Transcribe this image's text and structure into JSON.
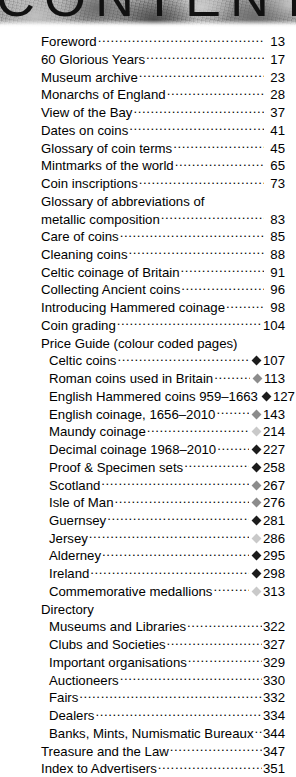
{
  "header": {
    "title": "CONTENTS"
  },
  "colors": {
    "diamond_dark": "#1c1c1c",
    "diamond_mid": "#8c8c8c",
    "diamond_light": "#c9c9c9",
    "text": "#000000"
  },
  "toc": {
    "entries": [
      {
        "label": "Foreword",
        "page": "13",
        "indent": 0,
        "marker": "none"
      },
      {
        "label": "60 Glorious Years",
        "page": "17",
        "indent": 0,
        "marker": "none"
      },
      {
        "label": "Museum archive",
        "page": "23",
        "indent": 0,
        "marker": "none"
      },
      {
        "label": "Monarchs of England",
        "page": "28",
        "indent": 0,
        "marker": "none"
      },
      {
        "label": "View of the Bay",
        "page": "37",
        "indent": 0,
        "marker": "none"
      },
      {
        "label": "Dates on coins",
        "page": "41",
        "indent": 0,
        "marker": "none"
      },
      {
        "label": "Glossary of coin terms",
        "page": "45",
        "indent": 0,
        "marker": "none"
      },
      {
        "label": "Mintmarks of the world",
        "page": "65",
        "indent": 0,
        "marker": "none"
      },
      {
        "label": "Coin inscriptions",
        "page": "73",
        "indent": 0,
        "marker": "none"
      },
      {
        "label": "Glossary of abbreviations of",
        "page": "",
        "indent": 0,
        "marker": "none",
        "continues": true
      },
      {
        "label": "metallic composition",
        "page": "83",
        "indent": 0,
        "marker": "none"
      },
      {
        "label": "Care of coins",
        "page": "85",
        "indent": 0,
        "marker": "none"
      },
      {
        "label": "Cleaning coins",
        "page": "88",
        "indent": 0,
        "marker": "none"
      },
      {
        "label": "Celtic coinage of Britain",
        "page": "91",
        "indent": 0,
        "marker": "none"
      },
      {
        "label": "Collecting Ancient coins",
        "page": "96",
        "indent": 0,
        "marker": "none"
      },
      {
        "label": "Introducing Hammered coinage",
        "page": "98",
        "indent": 0,
        "marker": "none"
      },
      {
        "label": "Coin grading",
        "page": "104",
        "indent": 0,
        "marker": "none"
      },
      {
        "label": "Price Guide (colour coded pages)",
        "page": "",
        "indent": 0,
        "marker": "none",
        "heading": true
      },
      {
        "label": "Celtic coins",
        "page": "107",
        "indent": 1,
        "marker": "dark"
      },
      {
        "label": "Roman coins used in Britain",
        "page": "113",
        "indent": 1,
        "marker": "mid"
      },
      {
        "label": "English Hammered coins 959–1663",
        "page": "127",
        "indent": 1,
        "marker": "dark"
      },
      {
        "label": "English coinage, 1656–2010",
        "page": "143",
        "indent": 1,
        "marker": "mid"
      },
      {
        "label": "Maundy coinage",
        "page": "214",
        "indent": 1,
        "marker": "light"
      },
      {
        "label": "Decimal coinage 1968–2010",
        "page": "227",
        "indent": 1,
        "marker": "dark"
      },
      {
        "label": "Proof & Specimen sets",
        "page": "258",
        "indent": 1,
        "marker": "dark"
      },
      {
        "label": "Scotland",
        "page": "267",
        "indent": 1,
        "marker": "mid"
      },
      {
        "label": "Isle of Man",
        "page": "276",
        "indent": 1,
        "marker": "mid"
      },
      {
        "label": "Guernsey",
        "page": "281",
        "indent": 1,
        "marker": "dark"
      },
      {
        "label": "Jersey",
        "page": "286",
        "indent": 1,
        "marker": "light"
      },
      {
        "label": "Alderney",
        "page": "295",
        "indent": 1,
        "marker": "dark"
      },
      {
        "label": "Ireland",
        "page": "298",
        "indent": 1,
        "marker": "dark"
      },
      {
        "label": "Commemorative medallions",
        "page": "313",
        "indent": 1,
        "marker": "light"
      },
      {
        "label": "Directory",
        "page": "",
        "indent": 0,
        "marker": "none",
        "heading": true
      },
      {
        "label": "Museums and Libraries",
        "page": "322",
        "indent": 1,
        "marker": "none"
      },
      {
        "label": "Clubs and Societies",
        "page": "327",
        "indent": 1,
        "marker": "none"
      },
      {
        "label": "Important organisations",
        "page": "329",
        "indent": 1,
        "marker": "none"
      },
      {
        "label": "Auctioneers",
        "page": "330",
        "indent": 1,
        "marker": "none"
      },
      {
        "label": "Fairs",
        "page": "332",
        "indent": 1,
        "marker": "none"
      },
      {
        "label": "Dealers",
        "page": "334",
        "indent": 1,
        "marker": "none"
      },
      {
        "label": "Banks, Mints, Numismatic Bureaux",
        "page": "344",
        "indent": 1,
        "marker": "none"
      },
      {
        "label": "Treasure and the Law",
        "page": "347",
        "indent": 0,
        "marker": "none"
      },
      {
        "label": "Index to Advertisers",
        "page": "351",
        "indent": 0,
        "marker": "none"
      }
    ]
  }
}
